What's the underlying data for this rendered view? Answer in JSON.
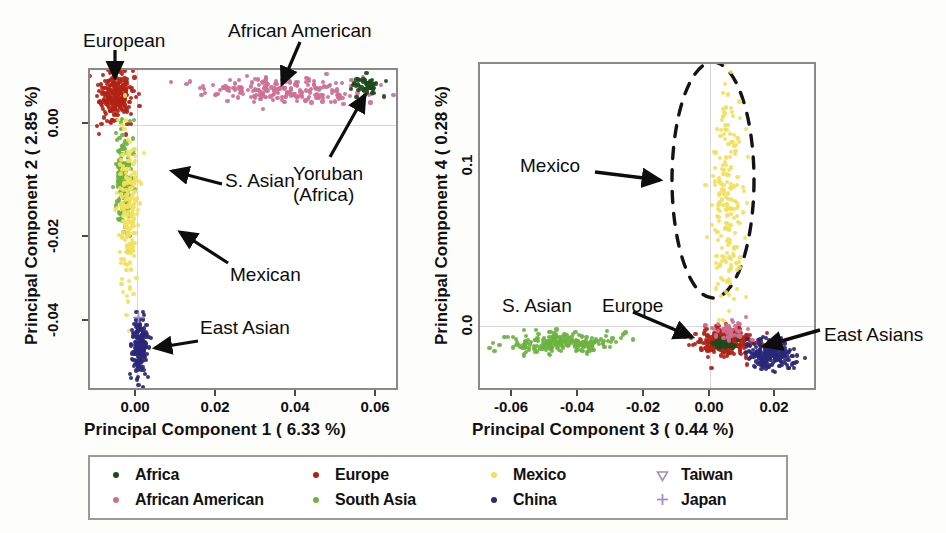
{
  "figure": {
    "title": "",
    "background": "#fdfdfc"
  },
  "colors": {
    "africa": "#1c4a1c",
    "african_american": "#ce6f92",
    "europe": "#b22216",
    "south_asia": "#6cb33f",
    "mexico": "#f2e05a",
    "china": "#2b2878",
    "taiwan": "#9f8fc6",
    "japan": "#9f8fc6",
    "frame": "#8a8a8a",
    "grid": "#d8d8d4",
    "text": "#0d0d0d"
  },
  "legend": {
    "name": "population-legend",
    "entries": [
      {
        "label": "Africa",
        "color": "#1c4a1c",
        "marker": "dot"
      },
      {
        "label": "African American",
        "color": "#ce6f92",
        "marker": "dot"
      },
      {
        "label": "Europe",
        "color": "#b22216",
        "marker": "dot"
      },
      {
        "label": "South Asia",
        "color": "#6cb33f",
        "marker": "dot"
      },
      {
        "label": "Mexico",
        "color": "#f2e05a",
        "marker": "dot"
      },
      {
        "label": "China",
        "color": "#2b2878",
        "marker": "dot"
      },
      {
        "label": "Taiwan",
        "color": "#9f8fc6",
        "marker": "triangle-down-open"
      },
      {
        "label": "Japan",
        "color": "#9f8fc6",
        "marker": "plus"
      }
    ]
  },
  "panels": [
    {
      "id": "left",
      "xlabel": "Principal Component 1  ( 6.33 %)",
      "ylabel": "Principal Component 2  ( 2.85 %)",
      "xticks": [
        "0.00",
        "0.02",
        "0.04",
        "0.06"
      ],
      "yticks": [
        "0.00",
        "-0.02",
        "-0.04"
      ],
      "xlim": [
        -0.012,
        0.066
      ],
      "ylim": [
        -0.063,
        0.012
      ],
      "annotations": [
        {
          "text": "European",
          "name": "annot-european"
        },
        {
          "text": "African American",
          "name": "annot-african-american"
        },
        {
          "text": "Yoruban\n(Africa)",
          "name": "annot-yoruban"
        },
        {
          "text": "S. Asian",
          "name": "annot-s-asian"
        },
        {
          "text": "Mexican",
          "name": "annot-mexican"
        },
        {
          "text": "East Asian",
          "name": "annot-east-asian"
        }
      ]
    },
    {
      "id": "right",
      "xlabel": "Principal Component 3  ( 0.44 %)",
      "ylabel": "Principal Component 4  ( 0.28 %)",
      "xticks": [
        "-0.06",
        "-0.04",
        "-0.02",
        "0.00",
        "0.02"
      ],
      "yticks": [
        "0.1",
        "0.0"
      ],
      "xlim": [
        -0.075,
        0.029
      ],
      "ylim": [
        -0.035,
        0.185
      ],
      "annotations": [
        {
          "text": "Mexico",
          "name": "annot-mexico"
        },
        {
          "text": "S. Asian",
          "name": "annot-s-asian-right"
        },
        {
          "text": "Europe",
          "name": "annot-europe-right"
        },
        {
          "text": "East Asians",
          "name": "annot-east-asians-right"
        }
      ],
      "highlight_ellipse": {
        "label": "mexico-cluster-outline",
        "style": "dashed"
      }
    }
  ],
  "chart_data": {
    "type": "scatter",
    "title": "",
    "panels": [
      {
        "id": "pc1-pc2",
        "xlabel": "Principal Component 1  ( 6.33 %)",
        "ylabel": "Principal Component 2  ( 2.85 %)",
        "xlim": [
          -0.012,
          0.066
        ],
        "ylim": [
          -0.063,
          0.012
        ],
        "xticks": [
          0.0,
          0.02,
          0.04,
          0.06
        ],
        "yticks": [
          0.0,
          -0.02,
          -0.04
        ],
        "grid": false,
        "zero_reference_lines": {
          "x": 0.0,
          "y": 0.0
        },
        "legend_position": "below-figure",
        "clusters": [
          {
            "series": "Europe",
            "color": "#b22216",
            "n": 230,
            "cx": -0.0055,
            "cy": 0.006,
            "sx": 0.0022,
            "sy": 0.003
          },
          {
            "series": "African American",
            "color": "#ce6f92",
            "n": 210,
            "cx": 0.037,
            "cy": 0.0072,
            "sx": 0.011,
            "sy": 0.0016
          },
          {
            "series": "Africa",
            "color": "#1c4a1c",
            "n": 55,
            "cx": 0.0585,
            "cy": 0.0082,
            "sx": 0.0018,
            "sy": 0.0012
          },
          {
            "series": "South Asia",
            "color": "#6cb33f",
            "n": 170,
            "cx": -0.0035,
            "cy": -0.0145,
            "sx": 0.0011,
            "sy": 0.0055
          },
          {
            "series": "Mexico",
            "color": "#f2e05a",
            "n": 180,
            "cx": -0.0022,
            "cy": -0.0215,
            "sx": 0.0013,
            "sy": 0.0085
          },
          {
            "series": "China",
            "color": "#2b2878",
            "n": 180,
            "cx": 0.0005,
            "cy": -0.0535,
            "sx": 0.001,
            "sy": 0.0038
          },
          {
            "series": "Japan",
            "color": "#9f8fc6",
            "n": 1,
            "cx": 0.0002,
            "cy": -0.0455,
            "sx": 0.0,
            "sy": 0.0,
            "marker": "plus"
          }
        ]
      },
      {
        "id": "pc3-pc4",
        "xlabel": "Principal Component 3  ( 0.44 %)",
        "ylabel": "Principal Component 4  ( 0.28 %)",
        "xlim": [
          -0.075,
          0.029
        ],
        "ylim": [
          -0.035,
          0.185
        ],
        "xticks": [
          -0.06,
          -0.04,
          -0.02,
          0.0,
          0.02
        ],
        "yticks": [
          0.1,
          0.0
        ],
        "grid": false,
        "zero_reference_lines": {
          "x": 0.0,
          "y": 0.0
        },
        "legend_position": "below-figure",
        "clusters": [
          {
            "series": "Mexico",
            "color": "#f2e05a",
            "n": 190,
            "cx": 0.0018,
            "cy": 0.092,
            "sx": 0.0024,
            "sy": 0.038
          },
          {
            "series": "South Asia",
            "color": "#6cb33f",
            "n": 210,
            "cx": -0.05,
            "cy": -0.004,
            "sx": 0.0085,
            "sy": 0.0035
          },
          {
            "series": "Europe",
            "color": "#b22216",
            "n": 260,
            "cx": 0.0012,
            "cy": -0.0035,
            "sx": 0.0048,
            "sy": 0.0045
          },
          {
            "series": "Africa",
            "color": "#1c4a1c",
            "n": 60,
            "cx": 0.0008,
            "cy": -0.0048,
            "sx": 0.0022,
            "sy": 0.0016
          },
          {
            "series": "African American",
            "color": "#ce6f92",
            "n": 45,
            "cx": 0.0025,
            "cy": 0.005,
            "sx": 0.0025,
            "sy": 0.004
          },
          {
            "series": "China",
            "color": "#2b2878",
            "n": 200,
            "cx": 0.0155,
            "cy": -0.013,
            "sx": 0.0035,
            "sy": 0.005
          }
        ]
      }
    ]
  }
}
